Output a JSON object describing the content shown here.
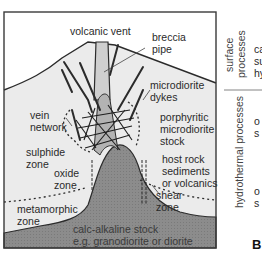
{
  "diagram": {
    "type": "geological cross-section",
    "colors": {
      "background": "#ffffff",
      "host_rock": "#ebebeb",
      "breccia_pipe": "#cfcfcf",
      "stock": "#a9a9a9",
      "calc_alkaline_stock": "#8a8a8a",
      "lines": "#2b2b2b",
      "frame": "#3a3a3a"
    },
    "labels": {
      "volcanic_vent": "volcanic vent",
      "breccia_pipe_1": "breccia",
      "breccia_pipe_2": "pipe",
      "microdiorite_dykes_1": "microdiorite",
      "microdiorite_dykes_2": "dykes",
      "porphyritic_1": "porphyritic",
      "porphyritic_2": "microdiorite",
      "porphyritic_3": "stock",
      "vein_network_1": "vein",
      "vein_network_2": "network",
      "sulphide_zone_1": "sulphide",
      "sulphide_zone_2": "zone",
      "oxide_zone_1": "oxide",
      "oxide_zone_2": "zone",
      "host_rock_1": "host rock",
      "host_rock_2": "sediments",
      "host_rock_3": "or volcanics",
      "metamorphic_zone_1": "metamorphic",
      "metamorphic_zone_2": "zone",
      "shear_zone_1": "shear",
      "shear_zone_2": "zone",
      "calc_alkaline_1": "calc-alkaline stock",
      "calc_alkaline_2": "e.g. granodiorite or diorite"
    },
    "side_panel": {
      "surface_processes_1": "surface",
      "surface_processes_2": "processes",
      "hydrothermal_processes": "hydrothermal processes",
      "partial_1": "ca",
      "partial_2": "su",
      "partial_3": "hy",
      "partial_4": "o",
      "partial_5": "s",
      "partial_6": "o",
      "partial_7": "s",
      "panel_letter": "B"
    }
  }
}
